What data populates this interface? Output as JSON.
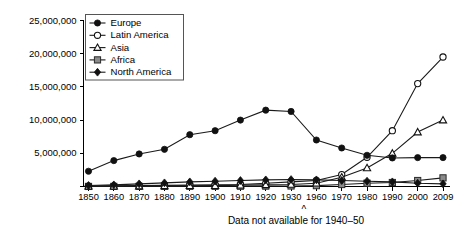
{
  "chart_data": {
    "type": "line",
    "title": "",
    "subtitle": "",
    "xlabel": "",
    "ylabel": "",
    "grid": false,
    "legend_position": "top-left",
    "categories": [
      "1850",
      "1860",
      "1870",
      "1880",
      "1890",
      "1900",
      "1910",
      "1920",
      "1930",
      "1960",
      "1970",
      "1980",
      "1990",
      "2000",
      "2009"
    ],
    "ylim": [
      0,
      25000000
    ],
    "yticks": [
      0,
      5000000,
      10000000,
      15000000,
      20000000,
      25000000
    ],
    "ytick_labels": [
      "",
      "5,000,000",
      "10,000,000",
      "15,000,000",
      "20,000,000",
      "25,000,000"
    ],
    "annotation": "Data not available for 1940–50",
    "gap_marker": "^",
    "series": [
      {
        "name": "Europe",
        "marker": "filled-circle",
        "color": "#111111",
        "values": [
          2300000,
          3900000,
          4900000,
          5600000,
          7800000,
          8400000,
          10000000,
          11500000,
          11300000,
          7000000,
          5800000,
          4700000,
          4300000,
          4350000,
          4350000
        ]
      },
      {
        "name": "Latin America",
        "marker": "open-circle",
        "color": "#111111",
        "values": [
          70000,
          100000,
          130000,
          170000,
          200000,
          250000,
          300000,
          480000,
          700000,
          900000,
          1800000,
          4400000,
          8400000,
          15500000,
          19500000
        ]
      },
      {
        "name": "Asia",
        "marker": "open-triangle",
        "color": "#111111",
        "values": [
          40000,
          50000,
          70000,
          110000,
          120000,
          130000,
          200000,
          250000,
          300000,
          500000,
          1400000,
          2800000,
          5000000,
          8200000,
          10000000
        ]
      },
      {
        "name": "Africa",
        "marker": "filled-square",
        "color": "#8a8a8a",
        "values": [
          10000,
          15000,
          20000,
          25000,
          30000,
          35000,
          45000,
          60000,
          80000,
          130000,
          300000,
          500000,
          600000,
          900000,
          1300000
        ]
      },
      {
        "name": "North America",
        "marker": "filled-diamond",
        "color": "#111111",
        "values": [
          150000,
          250000,
          400000,
          550000,
          700000,
          800000,
          900000,
          1000000,
          1050000,
          1000000,
          900000,
          800000,
          700000,
          500000,
          400000
        ]
      }
    ]
  }
}
